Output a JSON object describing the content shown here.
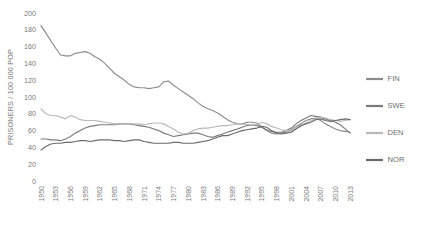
{
  "chart_data": {
    "type": "line",
    "title": "",
    "xlabel": "",
    "ylabel": "PRISONERS / 100 000 POP",
    "ylim": [
      0,
      200
    ],
    "ytick_labels": [
      "0",
      "20",
      "40",
      "60",
      "80",
      "100",
      "120",
      "140",
      "160",
      "180",
      "200"
    ],
    "ytick_values": [
      0,
      20,
      40,
      60,
      80,
      100,
      120,
      140,
      160,
      180,
      200
    ],
    "xlim": [
      1950,
      2014
    ],
    "xtick_labels": [
      "1950",
      "1953",
      "1956",
      "1959",
      "1962",
      "1965",
      "1968",
      "1971",
      "1974",
      "1977",
      "1980",
      "1983",
      "1986",
      "1989",
      "1992",
      "1995",
      "1998",
      "2001",
      "2004",
      "2007",
      "2010",
      "2013"
    ],
    "xtick_values": [
      1950,
      1953,
      1956,
      1959,
      1962,
      1965,
      1968,
      1971,
      1974,
      1977,
      1980,
      1983,
      1986,
      1989,
      1992,
      1995,
      1998,
      2001,
      2004,
      2007,
      2010,
      2013
    ],
    "grid": false,
    "legend_position": "right",
    "x": [
      1950,
      1951,
      1952,
      1953,
      1954,
      1955,
      1956,
      1957,
      1958,
      1959,
      1960,
      1961,
      1962,
      1963,
      1964,
      1965,
      1966,
      1967,
      1968,
      1969,
      1970,
      1971,
      1972,
      1973,
      1974,
      1975,
      1976,
      1977,
      1978,
      1979,
      1980,
      1981,
      1982,
      1983,
      1984,
      1985,
      1986,
      1987,
      1988,
      1989,
      1990,
      1991,
      1992,
      1993,
      1994,
      1995,
      1996,
      1997,
      1998,
      1999,
      2000,
      2001,
      2002,
      2003,
      2004,
      2005,
      2006,
      2007,
      2008,
      2009,
      2010,
      2011,
      2012,
      2013
    ],
    "series": [
      {
        "name": "FIN",
        "color": "#8c8c8c",
        "values": [
          185,
          176,
          167,
          158,
          150,
          149,
          149,
          152,
          153,
          154,
          152,
          148,
          145,
          140,
          134,
          128,
          124,
          120,
          115,
          112,
          111,
          111,
          110,
          111,
          112,
          118,
          119,
          114,
          110,
          106,
          102,
          98,
          93,
          89,
          86,
          84,
          81,
          77,
          73,
          70,
          68,
          68,
          70,
          70,
          69,
          64,
          60,
          57,
          56,
          57,
          58,
          61,
          65,
          68,
          72,
          74,
          75,
          72,
          68,
          65,
          62,
          60,
          59,
          58
        ]
      },
      {
        "name": "SWE",
        "color": "#7a7a7a",
        "values": [
          50,
          50,
          49,
          49,
          48,
          50,
          53,
          57,
          60,
          63,
          65,
          66,
          67,
          67,
          67,
          67,
          68,
          68,
          68,
          67,
          66,
          65,
          64,
          62,
          60,
          57,
          55,
          53,
          54,
          55,
          56,
          57,
          57,
          55,
          53,
          52,
          54,
          56,
          58,
          60,
          62,
          64,
          66,
          67,
          66,
          64,
          61,
          59,
          58,
          58,
          60,
          63,
          68,
          72,
          75,
          78,
          77,
          76,
          74,
          72,
          70,
          67,
          62,
          57
        ]
      },
      {
        "name": "DEN",
        "color": "#b9b9b9",
        "values": [
          86,
          80,
          78,
          78,
          76,
          74,
          78,
          76,
          73,
          72,
          72,
          72,
          71,
          70,
          69,
          68,
          68,
          68,
          68,
          68,
          68,
          67,
          68,
          69,
          69,
          68,
          65,
          62,
          58,
          56,
          57,
          60,
          62,
          63,
          63,
          64,
          65,
          66,
          66,
          67,
          68,
          68,
          67,
          67,
          67,
          70,
          68,
          65,
          63,
          61,
          60,
          59,
          63,
          65,
          69,
          72,
          74,
          76,
          75,
          73,
          72,
          71,
          72,
          73
        ]
      },
      {
        "name": "NOR",
        "color": "#6b6b6b",
        "values": [
          37,
          41,
          44,
          45,
          45,
          46,
          46,
          47,
          48,
          48,
          47,
          48,
          49,
          49,
          49,
          48,
          48,
          47,
          48,
          49,
          49,
          47,
          46,
          45,
          45,
          45,
          45,
          46,
          46,
          45,
          45,
          45,
          46,
          47,
          48,
          50,
          52,
          54,
          54,
          56,
          58,
          60,
          61,
          62,
          63,
          65,
          64,
          60,
          57,
          56,
          57,
          58,
          62,
          66,
          68,
          70,
          73,
          74,
          72,
          71,
          72,
          73,
          74,
          73
        ]
      }
    ]
  },
  "legend": {
    "items": [
      {
        "label": "FIN"
      },
      {
        "label": "SWE"
      },
      {
        "label": "DEN"
      },
      {
        "label": "NOR"
      }
    ]
  }
}
